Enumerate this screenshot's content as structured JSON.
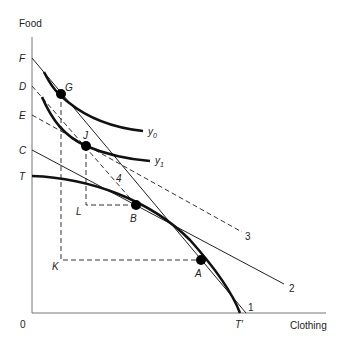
{
  "diagram": {
    "type": "economics-production-possibility-indifference",
    "axes": {
      "y_label": "Food",
      "x_label": "Clothing",
      "origin_label": "0"
    },
    "y_intercept_labels": [
      "F",
      "D",
      "E",
      "C",
      "T"
    ],
    "x_intercept_labels": [
      "T′"
    ],
    "points": [
      {
        "label": "G",
        "role": "tangency of line 1 with y0"
      },
      {
        "label": "J",
        "role": "tangency of lines 3/4 with y1"
      },
      {
        "label": "B",
        "role": "production point on T-T′"
      },
      {
        "label": "A",
        "role": "production point on T-T′"
      }
    ],
    "corner_labels": [
      "L",
      "K"
    ],
    "curves": [
      {
        "label": "y0",
        "kind": "indifference curve"
      },
      {
        "label": "y1",
        "kind": "indifference curve"
      },
      {
        "label": "TT′",
        "kind": "production possibility frontier"
      }
    ],
    "lines": [
      {
        "label": "1",
        "style": "solid",
        "from": "F",
        "through": "G"
      },
      {
        "label": "2",
        "style": "solid",
        "from": "C",
        "through": "B"
      },
      {
        "label": "3",
        "style": "dashed",
        "from": "E",
        "through": "J"
      },
      {
        "label": "4",
        "style": "dashed",
        "from": "D",
        "through": "J, B"
      }
    ]
  },
  "labels": {
    "food": "Food",
    "clothing": "Clothing",
    "origin": "0",
    "F": "F",
    "D": "D",
    "E": "E",
    "C": "C",
    "T": "T",
    "Tprime": "T′",
    "G": "G",
    "J": "J",
    "B": "B",
    "A": "A",
    "L": "L",
    "K": "K",
    "y0_main": "y",
    "y0_sub": "0",
    "y1_main": "y",
    "y1_sub": "1",
    "line1": "1",
    "line2": "2",
    "line3": "3",
    "line4": "4"
  }
}
